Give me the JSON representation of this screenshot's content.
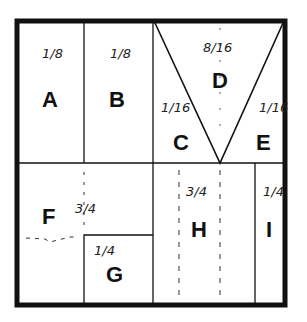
{
  "diagram": {
    "frame_color": "#111111",
    "sections": [
      {
        "id": "A",
        "label": "A",
        "fraction": "1/8"
      },
      {
        "id": "B",
        "label": "B",
        "fraction": "1/8"
      },
      {
        "id": "C",
        "label": "C",
        "fraction": "1/16"
      },
      {
        "id": "D",
        "label": "D",
        "fraction": "8/16"
      },
      {
        "id": "E",
        "label": "E",
        "fraction": "1/16"
      },
      {
        "id": "F",
        "label": "F",
        "fraction": "3/4"
      },
      {
        "id": "G",
        "label": "G",
        "fraction": "1/4"
      },
      {
        "id": "H",
        "label": "H",
        "fraction": "3/4"
      },
      {
        "id": "I",
        "label": "I",
        "fraction": "1/4"
      }
    ]
  }
}
